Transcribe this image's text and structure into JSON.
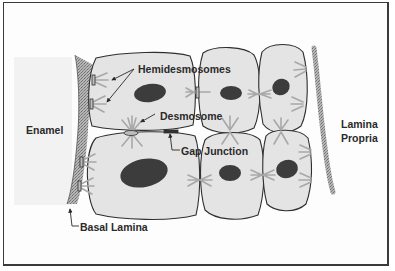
{
  "diagram": {
    "title": "",
    "colors": {
      "frame": "#3a3a3a",
      "cell_fill": "#e4e4e4",
      "cell_stroke": "#2f2f2f",
      "nucleus": "#3c3c3c",
      "filament": "#a8a8a8",
      "basal_lamina": "#9a9a9a",
      "enamel": "#f2f2f2",
      "label_text": "#2a2a2a"
    },
    "labels": {
      "hemidesmosomes": "Hemidesmosomes",
      "desmosome": "Desmosome",
      "gap_junction": "Gap Junction",
      "enamel": "Enamel",
      "basal_lamina": "Basal Lamina",
      "lamina_propria_line1": "Lamina",
      "lamina_propria_line2": "Propria"
    },
    "regions": [
      "Enamel",
      "Basal Lamina",
      "Epithelial cells",
      "Lamina Propria"
    ],
    "cells": {
      "count": 6,
      "rows": 2,
      "columns": 3
    }
  }
}
